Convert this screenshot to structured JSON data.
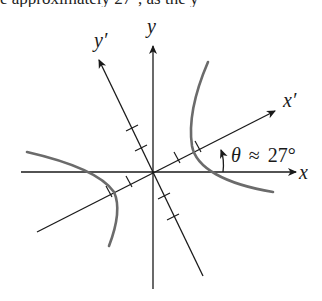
{
  "top_text": "e approximately 27°, as the y",
  "diagram": {
    "type": "rotated-axes-hyperbola",
    "axes": {
      "x_label": "x",
      "y_label": "y",
      "x_prime_label": "x′",
      "y_prime_label": "y′"
    },
    "angle_annotation": {
      "symbol": "θ",
      "relation": "≈",
      "value": "27°",
      "full": "θ ≈ 27°"
    },
    "rotation_degrees": 27,
    "tick_marks_per_half_axis": 2,
    "colors": {
      "axes": "#1a1a1a",
      "hyperbola": "#6b6b6b",
      "background": "#ffffff"
    }
  }
}
